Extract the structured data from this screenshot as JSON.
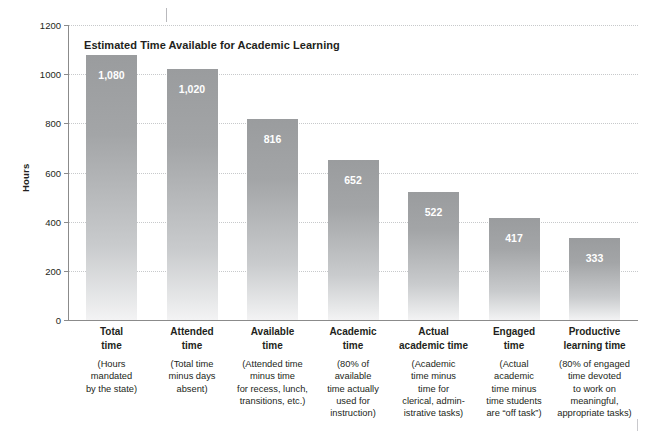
{
  "chart_data": {
    "type": "bar",
    "title": "Estimated Time Available for Academic Learning",
    "xlabel": "",
    "ylabel": "Hours",
    "ylim": [
      0,
      1200
    ],
    "grid": true,
    "legend": "none",
    "yticks": [
      "0",
      "200",
      "400",
      "600",
      "800",
      "1000",
      "1200"
    ],
    "ytick_values": [
      0,
      200,
      400,
      600,
      800,
      1000,
      1200
    ],
    "categories": [
      "Total\ntime",
      "Attended\ntime",
      "Available\ntime",
      "Academic\ntime",
      "Actual\nacademic time",
      "Engaged\ntime",
      "Productive\nlearning time"
    ],
    "values": [
      1080,
      1020,
      816,
      652,
      522,
      417,
      333
    ],
    "value_labels": [
      "1,080",
      "1,020",
      "816",
      "652",
      "522",
      "417",
      "333"
    ],
    "annotations": [
      "(Hours\nmandated\nby the state)",
      "(Total time\nminus days\nabsent)",
      "(Attended time\nminus time\nfor recess, lunch,\ntransitions, etc.)",
      "(80% of\navailable\ntime actually\nused for\ninstruction)",
      "(Academic\ntime minus\ntime for\nclerical, admin-\nistrative tasks)",
      "(Actual\nacademic\ntime minus\ntime students\nare “off task”)",
      "(80% of engaged\ntime devoted\nto work on\nmeaningful,\nappropriate tasks)"
    ],
    "colors": {
      "bar_top": "#9a9c9e",
      "bar_bottom": "#f3f3f4",
      "axis": "#8b8b8b",
      "gridline": "#c7c9cb",
      "text": "#231f20",
      "value_label": "#ffffff",
      "background": "#ffffff"
    }
  }
}
